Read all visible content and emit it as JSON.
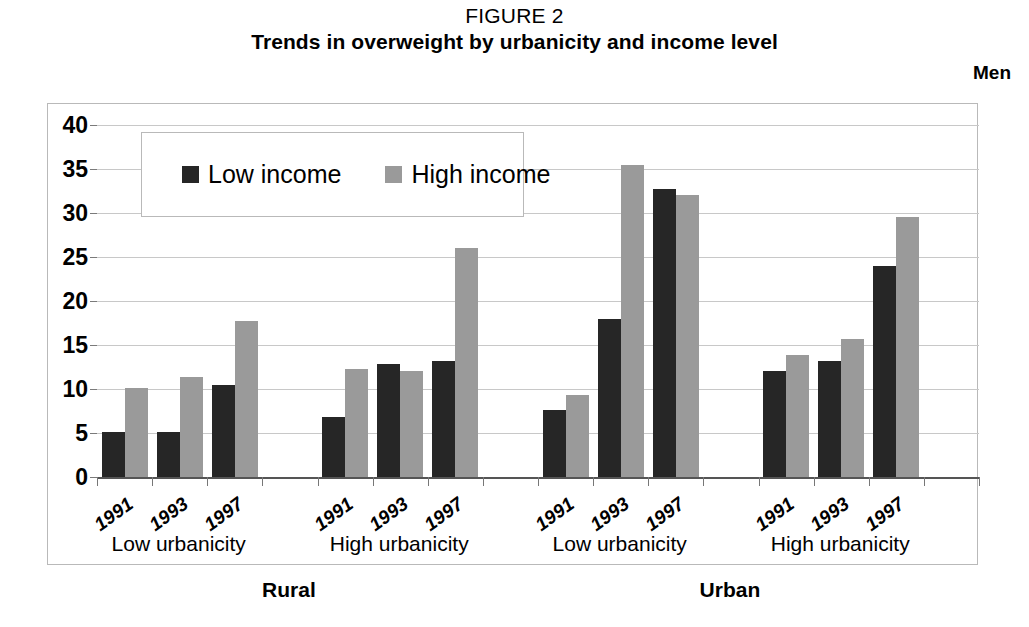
{
  "figure_label": "FIGURE 2",
  "title": "Trends in overweight by urbanicity and income level",
  "panel_label": "Men",
  "legend": {
    "low_label": "Low income",
    "high_label": "High income",
    "low_color": "#262626",
    "high_color": "#9a9a9a"
  },
  "colors": {
    "low_income": "#262626",
    "high_income": "#9a9a9a",
    "gridline": "#c8c8c8",
    "axis": "#555555",
    "frame": "#b9b9b9",
    "background": "#ffffff"
  },
  "axis": {
    "y_title": "Percentage",
    "y_ticks": [
      "0",
      "5",
      "10",
      "15",
      "20",
      "25",
      "30",
      "35",
      "40"
    ],
    "y_min": 0,
    "y_max": 40,
    "y_step": 5
  },
  "sections": [
    {
      "label": "Rural"
    },
    {
      "label": "Urban"
    }
  ],
  "groups": [
    {
      "label": "Low urbanicity",
      "section": "Rural",
      "years": [
        "1991",
        "1993",
        "1997"
      ]
    },
    {
      "label": "High urbanicity",
      "section": "Rural",
      "years": [
        "1991",
        "1993",
        "1997"
      ]
    },
    {
      "label": "Low urbanicity",
      "section": "Urban",
      "years": [
        "1991",
        "1993",
        "1997"
      ]
    },
    {
      "label": "High urbanicity",
      "section": "Urban",
      "years": [
        "1991",
        "1993",
        "1997"
      ]
    }
  ],
  "chart_data": {
    "type": "bar",
    "title": "Trends in overweight by urbanicity and income level",
    "subtitle": "FIGURE 2",
    "panel": "Men",
    "xlabel": "",
    "ylabel": "Percentage",
    "ylim": [
      0,
      40
    ],
    "ystep": 5,
    "grid": true,
    "legend_position": "top-left inside plot",
    "categories": [
      "Rural / Low urbanicity / 1991",
      "Rural / Low urbanicity / 1993",
      "Rural / Low urbanicity / 1997",
      "Rural / High urbanicity / 1991",
      "Rural / High urbanicity / 1993",
      "Rural / High urbanicity / 1997",
      "Urban / Low urbanicity / 1991",
      "Urban / Low urbanicity / 1993",
      "Urban / Low urbanicity / 1997",
      "Urban / High urbanicity / 1991",
      "Urban / High urbanicity / 1993",
      "Urban / High urbanicity / 1997"
    ],
    "series": [
      {
        "name": "Low income",
        "color": "#262626",
        "values": [
          5.1,
          5.1,
          10.4,
          6.8,
          12.8,
          13.2,
          7.6,
          17.9,
          32.7,
          12.0,
          13.2,
          24.0
        ]
      },
      {
        "name": "High income",
        "color": "#9a9a9a",
        "values": [
          10.1,
          11.4,
          17.7,
          12.3,
          12.1,
          26.0,
          9.3,
          35.4,
          32.0,
          13.9,
          15.7,
          29.5
        ]
      }
    ]
  }
}
